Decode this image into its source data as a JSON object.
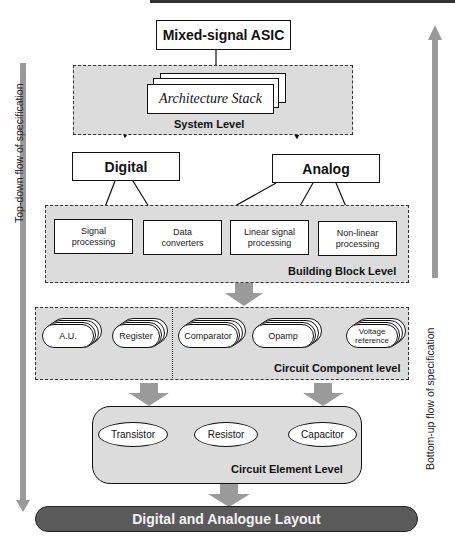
{
  "diagram": {
    "root": "Mixed-signal ASIC",
    "system_level": {
      "label": "System Level",
      "stack_label": "Architecture Stack"
    },
    "domains": {
      "digital": "Digital",
      "analog": "Analog"
    },
    "building_block_level": {
      "label": "Building Block Level",
      "blocks": [
        {
          "l1": "Signal",
          "l2": "processing"
        },
        {
          "l1": "Data",
          "l2": "converters"
        },
        {
          "l1": "Linear signal",
          "l2": "processing"
        },
        {
          "l1": "Non-linear",
          "l2": "processing"
        }
      ]
    },
    "circuit_component_level": {
      "label": "Circuit Component level",
      "components": [
        {
          "l1": "A.U.",
          "l2": ""
        },
        {
          "l1": "Register",
          "l2": ""
        },
        {
          "l1": "Comparator",
          "l2": ""
        },
        {
          "l1": "Opamp",
          "l2": ""
        },
        {
          "l1": "Voltage",
          "l2": "reference"
        }
      ]
    },
    "circuit_element_level": {
      "label": "Circuit Element Level",
      "elements": [
        "Transistor",
        "Resistor",
        "Capacitor"
      ]
    },
    "layout": "Digital and Analogue Layout",
    "side_labels": {
      "top_down": "Top-down flow of specification",
      "bottom_up": "Bottom-up flow of specification"
    },
    "colors": {
      "level_fill": "#dcdcdc",
      "arrow_fill": "#9a9a9a",
      "layout_fill": "#5a5a5a",
      "layout_text": "#f2f2f2"
    }
  }
}
